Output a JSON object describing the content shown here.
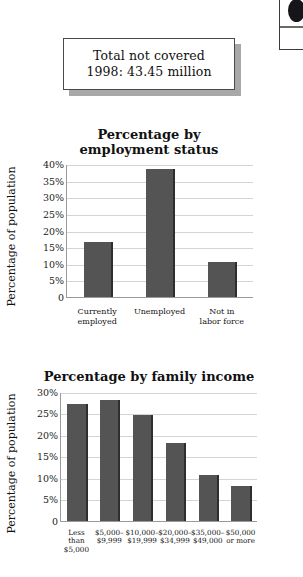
{
  "edge_element": {
    "name": "cut-off-sidebar-box",
    "bullet_icon": "filled-circle-icon"
  },
  "callout": {
    "line1": "Total not covered",
    "line2": "1998: 43.45 million"
  },
  "colors": {
    "bar": "#545454",
    "bar_shade": "#2e2e2e",
    "gridline": "#d4d4d4",
    "axis": "#9a9a9a",
    "callout_shadow": "#a8a8a8",
    "background": "#ffffff"
  },
  "chart_data": [
    {
      "id": "employment-status",
      "type": "bar",
      "title": "Percentage by\nemployment status",
      "title_line1": "Percentage by",
      "title_line2": "employment status",
      "xlabel": "",
      "ylabel": "Percentage of population",
      "ylim": [
        0,
        40
      ],
      "ytick_values": [
        0,
        5,
        10,
        15,
        20,
        25,
        30,
        35,
        40
      ],
      "ytick_labels": [
        "0",
        "5%",
        "10%",
        "15%",
        "20%",
        "25%",
        "30%",
        "35%",
        "40%"
      ],
      "grid": true,
      "legend": "none",
      "categories": [
        "Currently\nemployed",
        "Unemployed",
        "Not in\nlabor force"
      ],
      "values": [
        16.5,
        38.5,
        10.5
      ]
    },
    {
      "id": "family-income",
      "type": "bar",
      "title": "Percentage by family income",
      "title_line1": "Percentage by family income",
      "title_line2": "",
      "xlabel": "",
      "ylabel": "Percentage of population",
      "ylim": [
        0,
        30
      ],
      "ytick_values": [
        0,
        5,
        10,
        15,
        20,
        25,
        30
      ],
      "ytick_labels": [
        "0",
        "5%",
        "10%",
        "15%",
        "20%",
        "25%",
        "30%"
      ],
      "grid": true,
      "legend": "none",
      "categories": [
        "Less\nthan\n$5,000",
        "$5,000–\n$9,999",
        "$10,000–\n$19,999",
        "$20,000–\n$34,999",
        "$35,000–\n$49,000",
        "$50,000\nor more"
      ],
      "values": [
        27,
        28,
        24.5,
        18,
        10.5,
        8
      ]
    }
  ]
}
